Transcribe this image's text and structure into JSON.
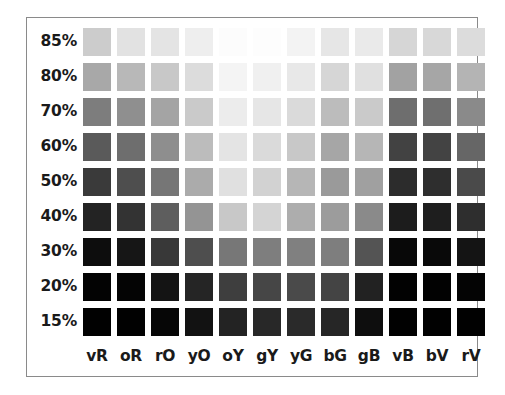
{
  "chart_data": {
    "type": "heatmap",
    "title": "",
    "subtitle": "",
    "xlabel": "",
    "ylabel": "",
    "legend_position": "none",
    "grid": false,
    "render_mode": "grayscale",
    "categories": [
      "vR",
      "oR",
      "rO",
      "yO",
      "oY",
      "gY",
      "yG",
      "bG",
      "gB",
      "vB",
      "bV",
      "rV"
    ],
    "row_labels": [
      "85%",
      "80%",
      "70%",
      "60%",
      "50%",
      "40%",
      "30%",
      "20%",
      "15%"
    ],
    "row_values": [
      85,
      80,
      70,
      60,
      50,
      40,
      30,
      20,
      15
    ],
    "cell_colors": [
      [
        "#cccccc",
        "#e2e2e2",
        "#e4e4e4",
        "#eeeeee",
        "#fcfcfc",
        "#fdfdfd",
        "#f3f3f3",
        "#e6e6e6",
        "#eaeaea",
        "#d6d6d6",
        "#d8d8d8",
        "#dcdcdc"
      ],
      [
        "#a8a8a8",
        "#b8b8b8",
        "#c8c8c8",
        "#dcdcdc",
        "#f4f4f4",
        "#f0f0f0",
        "#e8e8e8",
        "#d6d6d6",
        "#e0e0e0",
        "#a2a2a2",
        "#a6a6a6",
        "#b4b4b4"
      ],
      [
        "#7d7d7d",
        "#8f8f8f",
        "#a4a4a4",
        "#cacaca",
        "#ececec",
        "#e6e6e6",
        "#dadada",
        "#bcbcbc",
        "#cacaca",
        "#6e6e6e",
        "#6f6f6f",
        "#8a8a8a"
      ],
      [
        "#5a5a5a",
        "#6e6e6e",
        "#8e8e8e",
        "#bcbcbc",
        "#e4e4e4",
        "#dadada",
        "#c8c8c8",
        "#a6a6a6",
        "#b6b6b6",
        "#424242",
        "#434343",
        "#666666"
      ],
      [
        "#3a3a3a",
        "#4e4e4e",
        "#767676",
        "#ababab",
        "#e0e0e0",
        "#d2d2d2",
        "#b6b6b6",
        "#9a9a9a",
        "#a0a0a0",
        "#2c2c2c",
        "#2e2e2e",
        "#4a4a4a"
      ],
      [
        "#232323",
        "#333333",
        "#5e5e5e",
        "#949494",
        "#c8c8c8",
        "#d4d4d4",
        "#adadad",
        "#9c9c9c",
        "#8a8a8a",
        "#1c1c1c",
        "#1e1e1e",
        "#2e2e2e"
      ],
      [
        "#0d0d0d",
        "#161616",
        "#383838",
        "#4e4e4e",
        "#777777",
        "#7e7e7e",
        "#808080",
        "#7e7e7e",
        "#545454",
        "#080808",
        "#090909",
        "#141414"
      ],
      [
        "#030303",
        "#040404",
        "#141414",
        "#252525",
        "#3e3e3e",
        "#464646",
        "#4a4a4a",
        "#444444",
        "#222222",
        "#020202",
        "#020202",
        "#040404"
      ],
      [
        "#010101",
        "#010101",
        "#060606",
        "#121212",
        "#232323",
        "#282828",
        "#2a2a2a",
        "#262626",
        "#0e0e0e",
        "#010101",
        "#010101",
        "#010101"
      ]
    ],
    "cell_gray_values": [
      [
        204,
        226,
        228,
        238,
        252,
        253,
        243,
        230,
        234,
        214,
        216,
        220
      ],
      [
        168,
        184,
        200,
        220,
        244,
        240,
        232,
        214,
        224,
        162,
        166,
        180
      ],
      [
        125,
        143,
        164,
        202,
        236,
        230,
        218,
        188,
        202,
        110,
        111,
        138
      ],
      [
        90,
        110,
        142,
        188,
        228,
        218,
        200,
        166,
        182,
        66,
        67,
        102
      ],
      [
        58,
        78,
        118,
        171,
        224,
        210,
        182,
        154,
        160,
        44,
        46,
        74
      ],
      [
        35,
        51,
        94,
        148,
        200,
        212,
        173,
        156,
        138,
        28,
        30,
        46
      ],
      [
        13,
        22,
        56,
        78,
        119,
        126,
        128,
        126,
        84,
        8,
        9,
        20
      ],
      [
        3,
        4,
        20,
        37,
        62,
        70,
        74,
        68,
        34,
        2,
        2,
        4
      ],
      [
        1,
        1,
        6,
        18,
        35,
        40,
        42,
        38,
        14,
        1,
        1,
        1
      ]
    ]
  },
  "frame": {
    "border_color": "#8a8a8a",
    "background_color": "#ffffff"
  },
  "layout": {
    "cell_size": 28,
    "cell_pitch_x": 34,
    "cell_pitch_y": 35,
    "grid_origin_x": 56,
    "grid_origin_y": 10,
    "label_row_y": 326
  }
}
